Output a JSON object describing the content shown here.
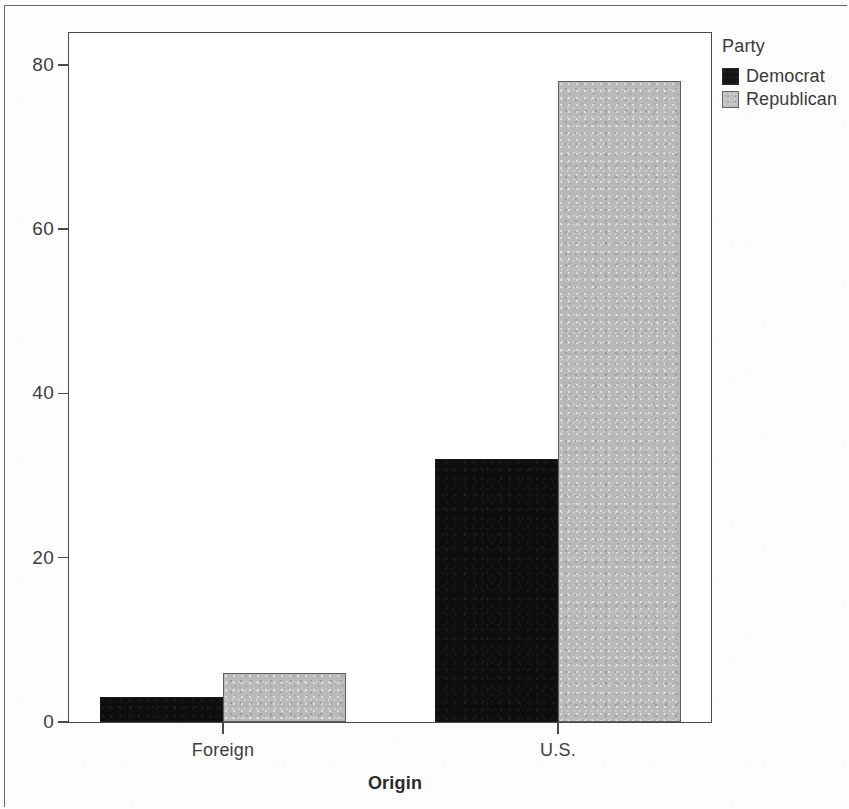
{
  "chart_data": {
    "type": "bar",
    "title": "",
    "xlabel": "Origin",
    "ylabel": "",
    "categories": [
      "Foreign",
      "U.S."
    ],
    "series": [
      {
        "name": "Democrat",
        "values": [
          3,
          32
        ],
        "color": "#0e0e0e"
      },
      {
        "name": "Republican",
        "values": [
          6,
          78
        ],
        "color": "#b9b9b9"
      }
    ],
    "ylim": [
      0,
      84
    ],
    "yticks": [
      0,
      20,
      40,
      60,
      80
    ],
    "ytick_labels": [
      "0",
      "20",
      "40",
      "60",
      "80"
    ],
    "grid": false,
    "legend": {
      "title": "Party",
      "position": "right-top",
      "entries": [
        "Democrat",
        "Republican"
      ]
    },
    "grouping": "grouped",
    "bar_style": "adjacent-within-group"
  },
  "axes": {
    "y_ticks": [
      {
        "label": "80",
        "value": 80
      },
      {
        "label": "60",
        "value": 60
      },
      {
        "label": "40",
        "value": 40
      },
      {
        "label": "20",
        "value": 20
      },
      {
        "label": "0",
        "value": 0
      }
    ],
    "x_ticks": [
      {
        "label": "Foreign"
      },
      {
        "label": "U.S."
      }
    ],
    "x_title": "Origin"
  },
  "legend": {
    "title": "Party",
    "items": [
      {
        "label": "Democrat",
        "swatch": "dem"
      },
      {
        "label": "Republican",
        "swatch": "rep"
      }
    ]
  },
  "bars": [
    {
      "name": "bar-foreign-democrat",
      "group": "Foreign",
      "series": "Democrat",
      "value": 3,
      "style": "dem"
    },
    {
      "name": "bar-foreign-republican",
      "group": "Foreign",
      "series": "Republican",
      "value": 6,
      "style": "rep"
    },
    {
      "name": "bar-us-democrat",
      "group": "U.S.",
      "series": "Democrat",
      "value": 32,
      "style": "dem"
    },
    {
      "name": "bar-us-republican",
      "group": "U.S.",
      "series": "Republican",
      "value": 78,
      "style": "rep"
    }
  ]
}
